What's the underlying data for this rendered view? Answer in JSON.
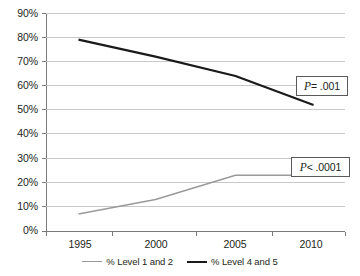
{
  "chart_data": {
    "type": "line",
    "title": "",
    "xlabel": "",
    "ylabel": "",
    "x": [
      1995,
      2000,
      2005,
      2010
    ],
    "categories": [
      "1995",
      "2000",
      "2005",
      "2010"
    ],
    "xlim": [
      1993,
      2012
    ],
    "ylim": [
      0,
      90
    ],
    "grid": true,
    "legend_position": "bottom",
    "y_tick_labels": [
      "90%",
      "80%",
      "70%",
      "60%",
      "50%",
      "40%",
      "30%",
      "20%",
      "10%",
      "0%"
    ],
    "y_tick_values": [
      90,
      80,
      70,
      60,
      50,
      40,
      30,
      20,
      10,
      0
    ],
    "x_tick_labels": [
      "1995",
      "2000",
      "2005",
      "2010"
    ],
    "series": [
      {
        "name": "% Level 1 and 2",
        "color": "#9a9a9a",
        "values": [
          7,
          13,
          23,
          23
        ]
      },
      {
        "name": "% Level 4 and 5",
        "color": "#1a1a1a",
        "values": [
          79,
          72,
          64,
          52
        ]
      }
    ],
    "annotations": [
      {
        "text_prefix": "P",
        "text_suffix": " = .001"
      },
      {
        "text_prefix": "P",
        "text_suffix": " < .0001"
      }
    ]
  },
  "legend": {
    "items": [
      {
        "label": "% Level 1 and 2"
      },
      {
        "label": "% Level 4 and 5"
      }
    ]
  }
}
